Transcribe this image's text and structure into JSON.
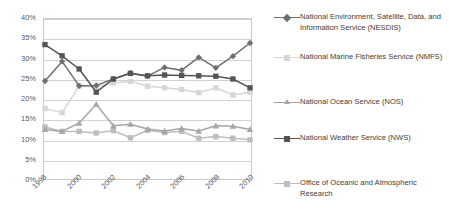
{
  "chart_data": {
    "type": "line",
    "title": "",
    "xlabel": "",
    "ylabel": "",
    "x": [
      1998,
      1999,
      2000,
      2001,
      2002,
      2003,
      2004,
      2005,
      2006,
      2007,
      2008,
      2009,
      2010
    ],
    "xlim": [
      1998,
      2010
    ],
    "ylim": [
      0,
      40
    ],
    "ytick_values": [
      0,
      5,
      10,
      15,
      20,
      25,
      30,
      35,
      40
    ],
    "ytick_labels": [
      "0%",
      "5%",
      "10%",
      "15%",
      "20%",
      "25%",
      "30%",
      "35%",
      "40%"
    ],
    "xtick_values": [
      1998,
      2000,
      2002,
      2004,
      2006,
      2008,
      2010
    ],
    "xtick_labels": [
      "1998",
      "2000",
      "2002",
      "2004",
      "2006",
      "2008",
      "2010"
    ],
    "grid": "horizontal",
    "legend_position": "right",
    "series": [
      {
        "name": "National Environment, Satellite, Data, and Information Service (NESDIS)",
        "short_name": "NESDIS",
        "marker": "diamond",
        "color": "#6e6e6e",
        "values": [
          24.5,
          29.4,
          23.3,
          23.4,
          25.0,
          26.5,
          25.7,
          27.9,
          27.2,
          30.4,
          27.8,
          30.7,
          34.0
        ]
      },
      {
        "name": "National Marine Fisheries Service (NMFS)",
        "short_name": "NMFS",
        "marker": "square",
        "color": "#d6d6d6",
        "values": [
          17.6,
          16.6,
          23.2,
          23.0,
          24.0,
          24.4,
          23.2,
          22.8,
          22.4,
          21.6,
          22.8,
          21.0,
          21.7
        ]
      },
      {
        "name": "National Ocean Service (NOS)",
        "short_name": "NOS",
        "marker": "triangle",
        "color": "#a6a6a6",
        "values": [
          12.4,
          11.9,
          14.0,
          18.7,
          13.3,
          13.7,
          12.5,
          12.0,
          12.6,
          12.0,
          13.3,
          13.2,
          12.4
        ]
      },
      {
        "name": "National Weather Service (NWS)",
        "short_name": "NWS",
        "marker": "square",
        "color": "#545454",
        "values": [
          33.6,
          30.8,
          27.5,
          21.7,
          25.0,
          26.4,
          25.8,
          26.0,
          25.9,
          25.8,
          25.7,
          25.0,
          22.8
        ]
      },
      {
        "name": "Office of Oceanic and Atmospheric Research",
        "short_name": "OAR",
        "marker": "square",
        "color": "#bdbdbd",
        "values": [
          13.0,
          11.9,
          11.9,
          11.5,
          12.1,
          10.3,
          12.2,
          11.6,
          11.9,
          10.2,
          10.6,
          10.2,
          9.8
        ]
      }
    ]
  },
  "legend": {
    "items": [
      {
        "label": "National Environment, Satellite, Data, and Information Service (NESDIS)"
      },
      {
        "label": "National Marine Fisheries Service (NMFS)"
      },
      {
        "label": "National Ocean Service (NOS)"
      },
      {
        "label": "National Weather Service (NWS)"
      },
      {
        "label": "Office of Oceanic and Atmospheric Research"
      }
    ]
  }
}
